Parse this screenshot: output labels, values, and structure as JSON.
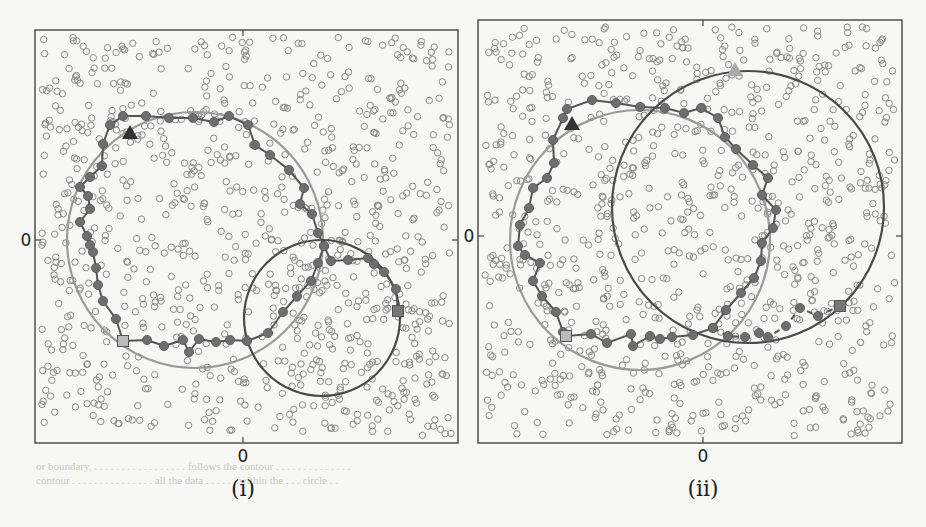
{
  "figure": {
    "panels": [
      {
        "caption": "(i)",
        "x_zero_label": "0",
        "y_zero_label": "0"
      },
      {
        "caption": "(ii)",
        "x_zero_label": "0",
        "y_zero_label": "0"
      }
    ],
    "background_text": "or boundary ... follows the contour ... all the data ... within the ... circle",
    "colors": {
      "dots": "#8a8a8a",
      "path_dark": "#555555",
      "path_fill": "#6e6e6e",
      "circle_light": "#9a9a9a",
      "circle_dark": "#4a4a4a",
      "frame": "#444444"
    }
  },
  "chart_data": [
    {
      "type": "scatter",
      "title": "(i)",
      "xlabel": "",
      "ylabel": "",
      "x_ticks": [
        "0"
      ],
      "y_ticks": [
        "0"
      ],
      "grid": false,
      "frame": {
        "x0": 35,
        "y0": 30,
        "x1": 458,
        "y1": 443
      },
      "zero": {
        "x": 243,
        "y": 240
      },
      "background_points": "~900 uniformly scattered open circles",
      "circles": [
        {
          "name": "large light circle",
          "cx": 195,
          "cy": 240,
          "r": 128,
          "color": "#9a9a9a"
        },
        {
          "name": "small dark circle",
          "cx": 322,
          "cy": 318,
          "r": 78,
          "color": "#4a4a4a"
        }
      ],
      "start_marker": {
        "shape": "triangle",
        "x": 130,
        "y": 133,
        "color": "#333333"
      },
      "path_markers": [
        {
          "shape": "square",
          "x": 123,
          "y": 341,
          "color": "#bbbbbb"
        },
        {
          "shape": "square",
          "x": 398,
          "y": 311,
          "color": "#777777"
        }
      ],
      "path": [
        [
          123,
          341
        ],
        [
          147,
          340
        ],
        [
          164,
          346
        ],
        [
          183,
          340
        ],
        [
          189,
          352
        ],
        [
          199,
          339
        ],
        [
          216,
          342
        ],
        [
          230,
          340
        ],
        [
          247,
          341
        ],
        [
          268,
          333
        ],
        [
          283,
          312
        ],
        [
          297,
          296
        ],
        [
          311,
          281
        ],
        [
          318,
          263
        ],
        [
          324,
          246
        ],
        [
          331,
          261
        ],
        [
          348,
          260
        ],
        [
          368,
          258
        ],
        [
          374,
          264
        ],
        [
          384,
          272
        ],
        [
          396,
          289
        ],
        [
          398,
          311
        ]
      ],
      "path_upper": [
        [
          123,
          341
        ],
        [
          116,
          319
        ],
        [
          103,
          301
        ],
        [
          98,
          285
        ],
        [
          96,
          268
        ],
        [
          93,
          252
        ],
        [
          90,
          245
        ],
        [
          87,
          236
        ],
        [
          80,
          222
        ],
        [
          90,
          209
        ],
        [
          88,
          196
        ],
        [
          80,
          187
        ],
        [
          90,
          177
        ],
        [
          102,
          166
        ],
        [
          103,
          144
        ],
        [
          110,
          125
        ],
        [
          123,
          116
        ],
        [
          146,
          116
        ],
        [
          169,
          118
        ],
        [
          193,
          118
        ],
        [
          214,
          122
        ],
        [
          229,
          116
        ],
        [
          248,
          125
        ],
        [
          255,
          145
        ],
        [
          270,
          155
        ],
        [
          289,
          170
        ],
        [
          304,
          188
        ],
        [
          300,
          204
        ],
        [
          312,
          214
        ],
        [
          318,
          233
        ],
        [
          324,
          246
        ]
      ]
    },
    {
      "type": "scatter",
      "title": "(ii)",
      "xlabel": "",
      "ylabel": "",
      "x_ticks": [
        "0"
      ],
      "y_ticks": [
        "0"
      ],
      "grid": false,
      "frame": {
        "x0": 478,
        "y0": 20,
        "x1": 902,
        "y1": 443
      },
      "zero": {
        "x": 703,
        "y": 236
      },
      "background_points": "~900 uniformly scattered open circles",
      "circles": [
        {
          "name": "large light circle",
          "cx": 640,
          "cy": 240,
          "r": 130,
          "color": "#9a9a9a"
        },
        {
          "name": "large dark circle",
          "cx": 748,
          "cy": 207,
          "r": 136,
          "color": "#4a4a4a"
        }
      ],
      "start_marker": {
        "shape": "triangle",
        "x": 572,
        "y": 124,
        "color": "#333333"
      },
      "end_marker": {
        "shape": "triangle",
        "x": 735,
        "y": 70,
        "color": "#aaaaaa"
      },
      "path_markers": [
        {
          "shape": "square",
          "x": 566,
          "y": 336,
          "color": "#bbbbbb"
        },
        {
          "shape": "square",
          "x": 840,
          "y": 306,
          "color": "#777777"
        }
      ],
      "path": [
        [
          566,
          336
        ],
        [
          591,
          334
        ],
        [
          607,
          343
        ],
        [
          631,
          334
        ],
        [
          633,
          346
        ],
        [
          650,
          336
        ],
        [
          660,
          339
        ],
        [
          672,
          337
        ],
        [
          693,
          335
        ],
        [
          713,
          328
        ],
        [
          726,
          310
        ],
        [
          741,
          293
        ],
        [
          754,
          278
        ],
        [
          761,
          261
        ],
        [
          762,
          243
        ],
        [
          773,
          228
        ],
        [
          776,
          210
        ],
        [
          762,
          195
        ],
        [
          768,
          178
        ],
        [
          753,
          165
        ],
        [
          736,
          149
        ],
        [
          725,
          137
        ],
        [
          718,
          118
        ],
        [
          701,
          108
        ],
        [
          684,
          113
        ],
        [
          665,
          108
        ],
        [
          640,
          107
        ],
        [
          616,
          103
        ],
        [
          592,
          100
        ],
        [
          567,
          109
        ],
        [
          563,
          118
        ],
        [
          553,
          140
        ],
        [
          554,
          163
        ],
        [
          547,
          178
        ],
        [
          533,
          188
        ],
        [
          529,
          208
        ],
        [
          520,
          225
        ],
        [
          518,
          246
        ],
        [
          525,
          255
        ],
        [
          540,
          263
        ],
        [
          533,
          281
        ],
        [
          542,
          296
        ],
        [
          556,
          312
        ],
        [
          563,
          332
        ],
        [
          566,
          336
        ]
      ],
      "path_tail": [
        [
          713,
          328
        ],
        [
          728,
          336
        ],
        [
          745,
          337
        ],
        [
          759,
          333
        ],
        [
          768,
          337
        ],
        [
          786,
          326
        ],
        [
          800,
          308
        ],
        [
          818,
          316
        ],
        [
          840,
          306
        ]
      ]
    }
  ]
}
